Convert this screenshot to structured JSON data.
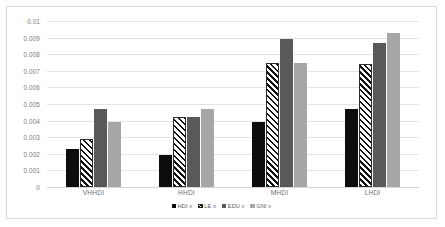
{
  "chart_data": {
    "type": "bar",
    "title": "",
    "subtitle": "",
    "xlabel": "",
    "ylabel": "",
    "categories": [
      "VHHDI",
      "HHDI",
      "MHDI",
      "LHDI"
    ],
    "series": [
      {
        "name": "HDI x",
        "color": "#0d0d0d",
        "fill": "solid-black",
        "values": [
          0.0023,
          0.0019,
          0.0039,
          0.0047
        ]
      },
      {
        "name": "LE x",
        "color": "#ffffff",
        "fill": "diagonal-hatch",
        "values": [
          0.0029,
          0.0042,
          0.0075,
          0.0074
        ]
      },
      {
        "name": "EDU x",
        "color": "#595959",
        "fill": "solid-dark-gray",
        "values": [
          0.0047,
          0.0042,
          0.0089,
          0.0087
        ]
      },
      {
        "name": "GNI x",
        "color": "#a6a6a6",
        "fill": "solid-light-gray",
        "values": [
          0.0039,
          0.0047,
          0.0075,
          0.0093
        ]
      }
    ],
    "ylim": [
      0,
      0.01
    ],
    "ytick_step": 0.001,
    "yticks": [
      "0",
      "0.001",
      "0.002",
      "0.003",
      "0.004",
      "0.005",
      "0.006",
      "0.007",
      "0.008",
      "0.009",
      "0.01"
    ],
    "grid": "horizontal",
    "legend_position": "bottom-center",
    "axis_color": "#e4e4e4",
    "tick_label_color": "#7a7a7a",
    "plot_background": "#ffffff",
    "frame_border_color": "#d9d9d9"
  }
}
